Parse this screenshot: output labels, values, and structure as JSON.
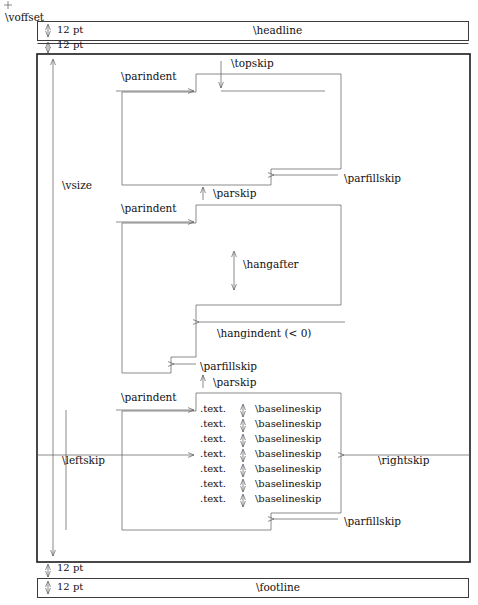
{
  "diagram": {
    "type": "tex-page-layout",
    "origin_mark": "+",
    "labels": {
      "voffset": "\\voffset",
      "headline": "\\headline",
      "footline": "\\footline",
      "vsize": "\\vsize",
      "topskip": "\\topskip",
      "parindent": "\\parindent",
      "parskip": "\\parskip",
      "parfillskip": "\\parfillskip",
      "baselineskip": "\\baselineskip",
      "hangafter": "\\hangafter",
      "hangindent": "\\hangindent (< 0)",
      "leftskip": "\\leftskip",
      "rightskip": "\\rightskip",
      "twelve_pt": "12 pt",
      "text_line": ".text."
    }
  },
  "headline_row": {
    "gap_label": "12 pt",
    "box_label": "\\headline"
  },
  "gap_after_headline": {
    "gap_label": "12 pt"
  },
  "gap_before_footline": {
    "gap_label": "12 pt"
  },
  "footline_row": {
    "gap_label": "12 pt",
    "box_label": "\\footline"
  },
  "main_box": {
    "height_label": "\\vsize",
    "left_margin_label": "\\leftskip",
    "right_margin_label": "\\rightskip"
  },
  "paragraph_one": {
    "indent_label": "\\parindent",
    "topskip_label": "\\topskip",
    "fill_label": "\\parfillskip",
    "parskip_label": "\\parskip"
  },
  "paragraph_two": {
    "indent_label": "\\parindent",
    "hangafter_label": "\\hangafter",
    "hangindent_label": "\\hangindent (< 0)",
    "fill_label": "\\parfillskip",
    "parskip_label": "\\parskip"
  },
  "paragraph_three": {
    "indent_label": "\\parindent",
    "fill_label": "\\parfillskip",
    "lines": [
      {
        "text": ".text.",
        "skip": "\\baselineskip"
      },
      {
        "text": ".text.",
        "skip": "\\baselineskip"
      },
      {
        "text": ".text.",
        "skip": "\\baselineskip"
      },
      {
        "text": ".text.",
        "skip": "\\baselineskip"
      },
      {
        "text": ".text.",
        "skip": "\\baselineskip"
      },
      {
        "text": ".text.",
        "skip": "\\baselineskip"
      },
      {
        "text": ".text.",
        "skip": "\\baselineskip"
      }
    ]
  },
  "colors": {
    "ink": "#1a1a1a",
    "hairline": "#5a5a5a",
    "background": "#ffffff"
  }
}
